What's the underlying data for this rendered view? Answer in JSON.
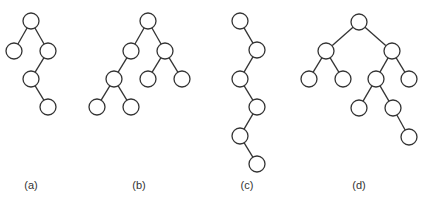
{
  "diagram": {
    "type": "binary-tree-figure",
    "colors": {
      "stroke": "#333333",
      "fill": "#ffffff",
      "background": "#ffffff"
    },
    "trees": [
      {
        "id": "a",
        "label": "(a)",
        "nodes": [
          "r",
          "L",
          "R",
          "RL",
          "RLR"
        ],
        "edges": [
          [
            "r",
            "L"
          ],
          [
            "r",
            "R"
          ],
          [
            "R",
            "RL"
          ],
          [
            "RL",
            "RLR"
          ]
        ]
      },
      {
        "id": "b",
        "label": "(b)",
        "nodes": [
          "r",
          "L",
          "R",
          "LL",
          "RL",
          "RR",
          "LLL",
          "LLR"
        ],
        "edges": [
          [
            "r",
            "L"
          ],
          [
            "r",
            "R"
          ],
          [
            "L",
            "LL"
          ],
          [
            "R",
            "RL"
          ],
          [
            "R",
            "RR"
          ],
          [
            "LL",
            "LLL"
          ],
          [
            "LL",
            "LLR"
          ]
        ]
      },
      {
        "id": "c",
        "label": "(c)",
        "nodes": [
          "r",
          "R",
          "RL",
          "RLR",
          "RLRL",
          "RLRLR"
        ],
        "edges": [
          [
            "r",
            "R"
          ],
          [
            "R",
            "RL"
          ],
          [
            "RL",
            "RLR"
          ],
          [
            "RLR",
            "RLRL"
          ],
          [
            "RLRL",
            "RLRLR"
          ]
        ]
      },
      {
        "id": "d",
        "label": "(d)",
        "nodes": [
          "r",
          "L",
          "R",
          "LL",
          "LR",
          "RL",
          "RR",
          "RLL",
          "RLR",
          "RLRR"
        ],
        "edges": [
          [
            "r",
            "L"
          ],
          [
            "r",
            "R"
          ],
          [
            "L",
            "LL"
          ],
          [
            "L",
            "LR"
          ],
          [
            "R",
            "RL"
          ],
          [
            "R",
            "RR"
          ],
          [
            "RL",
            "RLL"
          ],
          [
            "RL",
            "RLR"
          ],
          [
            "RLR",
            "RLRR"
          ]
        ]
      }
    ]
  }
}
